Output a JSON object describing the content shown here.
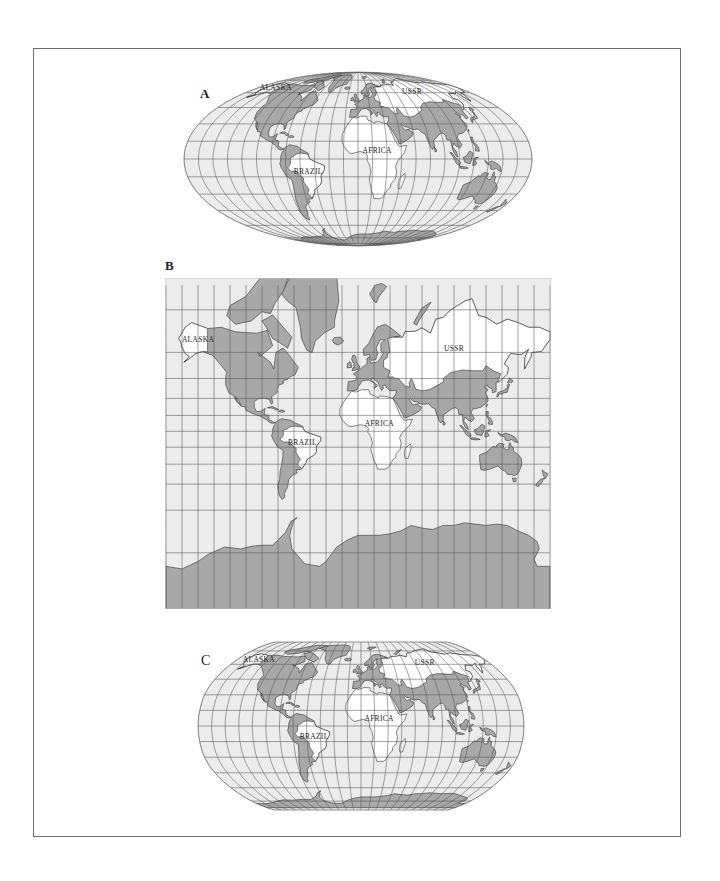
{
  "figure": {
    "panels": [
      {
        "id": "A",
        "label": "A",
        "projection": "mollweide",
        "box": {
          "x": 183,
          "y": 71,
          "w": 350,
          "h": 176
        },
        "label_pos": {
          "x": 200,
          "y": 95
        }
      },
      {
        "id": "B",
        "label": "B",
        "projection": "mercator",
        "box": {
          "x": 165,
          "y": 278,
          "w": 386,
          "h": 331
        },
        "label_pos": {
          "x": 200,
          "y": 268
        }
      },
      {
        "id": "C",
        "label": "C",
        "projection": "robinson",
        "box": {
          "x": 197,
          "y": 641,
          "w": 328,
          "h": 170
        },
        "label_pos": {
          "x": 202,
          "y": 662
        }
      }
    ],
    "region_labels": [
      "ALASKA",
      "USSR",
      "AFRICA",
      "BRAZIL"
    ],
    "label_coords": {
      "ALASKA": [
        -150,
        66
      ],
      "USSR": [
        90,
        62
      ],
      "AFRICA": [
        20,
        8
      ],
      "BRAZIL": [
        -52,
        -10
      ]
    },
    "colors": {
      "ocean": "#ececec",
      "land": "#a8a8a8",
      "highlight_land": "#ffffff",
      "coast": "#333333",
      "grid": "#555555",
      "frame": "#6e6e6e",
      "text": "#222222"
    },
    "grid": {
      "lon_step": 15,
      "lat_step": 15
    }
  }
}
